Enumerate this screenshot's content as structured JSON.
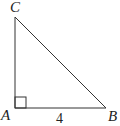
{
  "diagram": {
    "type": "right-triangle",
    "vertices": {
      "A": {
        "label": "A",
        "x": 15,
        "y": 108
      },
      "B": {
        "label": "B",
        "x": 106,
        "y": 108
      },
      "C": {
        "label": "C",
        "x": 15,
        "y": 17
      }
    },
    "right_angle_at": "A",
    "side_labels": {
      "AB": "4"
    },
    "stroke_color": "#333333"
  }
}
